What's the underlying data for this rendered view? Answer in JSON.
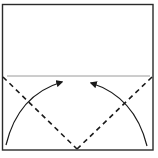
{
  "diagram": {
    "type": "origami-fold-diagram",
    "colors": {
      "background": "#ffffff",
      "outline": "#2a2a2a",
      "crease": "#9a9a9a",
      "fold_line": "#1a1a1a",
      "arrow": "#1a1a1a"
    },
    "paper": {
      "x": 2.5,
      "y": 4.5,
      "width": 150.5,
      "height": 145.5
    },
    "crease_line": {
      "x1": 7,
      "y1": 76,
      "x2": 150,
      "y2": 76
    },
    "fold_lines": [
      {
        "name": "left-valley-fold",
        "x1": 3,
        "y1": 77,
        "x2": 77,
        "y2": 149
      },
      {
        "name": "right-valley-fold",
        "x1": 152,
        "y1": 77,
        "x2": 77,
        "y2": 149
      }
    ],
    "arrows": [
      {
        "name": "left-fold-arrow",
        "path": "M 6 145 Q 18 95 62 82"
      },
      {
        "name": "right-fold-arrow",
        "path": "M 147 146 Q 135 97 91 83"
      }
    ]
  }
}
